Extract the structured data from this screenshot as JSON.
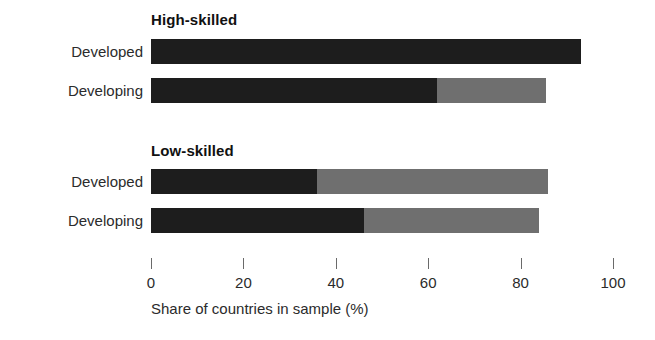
{
  "chart_data": {
    "type": "bar",
    "orientation": "horizontal",
    "stacked": true,
    "title": "",
    "xlabel": "Share of countries in sample (%)",
    "ylabel": "",
    "xlim": [
      0,
      100
    ],
    "xticks": [
      0,
      20,
      40,
      60,
      80,
      100
    ],
    "xtick_labels": [
      "0",
      "20",
      "40",
      "60",
      "80",
      "100"
    ],
    "grid": false,
    "legend": "none",
    "colors": {
      "dark": "#1d1d1d",
      "light": "#6f6f6f",
      "background": "#ffffff",
      "text": "#2b2b2b",
      "axis": "#6a6a6a"
    },
    "groups": [
      {
        "name": "High-skilled",
        "categories": [
          "Developed",
          "Developing"
        ],
        "series": [
          {
            "name": "dark",
            "values": [
              93,
              62
            ]
          },
          {
            "name": "light",
            "values": [
              0,
              23.5
            ]
          }
        ],
        "totals": [
          93,
          85.5
        ]
      },
      {
        "name": "Low-skilled",
        "categories": [
          "Developed",
          "Developing"
        ],
        "series": [
          {
            "name": "dark",
            "values": [
              36,
              46
            ]
          },
          {
            "name": "light",
            "values": [
              50,
              38
            ]
          }
        ],
        "totals": [
          86,
          84
        ]
      }
    ]
  },
  "groups": [
    {
      "title": "High-skilled",
      "rows": [
        {
          "label": "Developed",
          "dark": 93,
          "light": 0
        },
        {
          "label": "Developing",
          "dark": 62,
          "light": 23.5
        }
      ]
    },
    {
      "title": "Low-skilled",
      "rows": [
        {
          "label": "Developed",
          "dark": 36,
          "light": 50
        },
        {
          "label": "Developing",
          "dark": 46,
          "light": 38
        }
      ]
    }
  ],
  "axis": {
    "title": "Share of countries in sample (%)",
    "ticks": [
      {
        "value": 0,
        "label": "0"
      },
      {
        "value": 20,
        "label": "20"
      },
      {
        "value": 40,
        "label": "40"
      },
      {
        "value": 60,
        "label": "60"
      },
      {
        "value": 80,
        "label": "80"
      },
      {
        "value": 100,
        "label": "100"
      }
    ],
    "min": 0,
    "max": 100,
    "pixel_width": 462
  }
}
